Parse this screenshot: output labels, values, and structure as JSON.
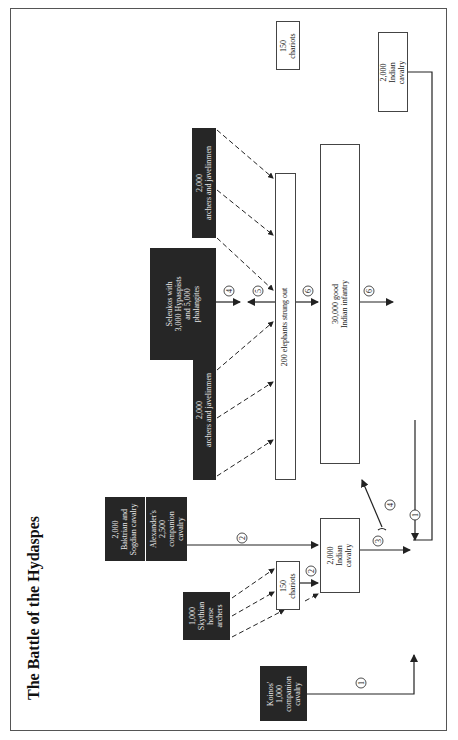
{
  "title": "The Battle of the Hydaspes",
  "units": {
    "koinos": {
      "line1": "Koinos'",
      "line2": "1,000",
      "line3": "companion",
      "line4": "cavalry"
    },
    "skythian": {
      "line1": "1,000",
      "line2": "Skythian",
      "line3": "horse",
      "line4": "archers"
    },
    "baktrian": {
      "line1": "2,000",
      "line2": "Baktrian and",
      "line3": "Sogdian cavalry"
    },
    "alexander": {
      "line1": "Alexander's",
      "line2": "2,500",
      "line3": "companion",
      "line4": "cavalry"
    },
    "archers_left": {
      "line1": "2,000",
      "line2": "archers and javelinmen"
    },
    "seleukos": {
      "line1": "Seleukos with",
      "line2": "3,000 Hypaspists",
      "line3": "and 5,000",
      "line4": "phalangites"
    },
    "archers_right": {
      "line1": "2,000",
      "line2": "archers and javelinmen"
    },
    "chariots_left": {
      "line1": "150",
      "line2": "chariots"
    },
    "indian_cavalry_left": {
      "line1": "2,000",
      "line2": "Indian",
      "line3": "cavalry"
    },
    "elephants": {
      "line1": "200 elephants strung out"
    },
    "infantry": {
      "line1": "30,000 good",
      "line2": "Indian infantry"
    },
    "indian_cavalry_right": {
      "line1": "2,000",
      "line2": "Indian",
      "line3": "cavalry"
    },
    "chariots_right": {
      "line1": "150",
      "line2": "chariots"
    }
  },
  "step_markers": [
    "1",
    "2",
    "2",
    "3",
    "4",
    "4",
    "5",
    "6",
    "6",
    "1"
  ]
}
